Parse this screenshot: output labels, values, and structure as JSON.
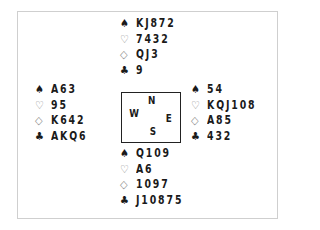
{
  "diagram": {
    "type": "bridge-deal",
    "suit_symbols": {
      "spades": "♠",
      "hearts": "♡",
      "diamonds": "◇",
      "clubs": "♣"
    },
    "colors": {
      "black_suit": "#1a1a1a",
      "red_suit_outline": "#8a8a8a",
      "frame": "#cfcfcf",
      "compass_border": "#222222"
    },
    "compass": {
      "north": "N",
      "south": "S",
      "east": "E",
      "west": "W"
    },
    "hands": {
      "north": {
        "spades": "KJ872",
        "hearts": "7432",
        "diamonds": "QJ3",
        "clubs": "9"
      },
      "west": {
        "spades": "A63",
        "hearts": "95",
        "diamonds": "K642",
        "clubs": "AKQ6"
      },
      "east": {
        "spades": "54",
        "hearts": "KQJ108",
        "diamonds": "A85",
        "clubs": "432"
      },
      "south": {
        "spades": "Q109",
        "hearts": "A6",
        "diamonds": "1097",
        "clubs": "J10875"
      }
    }
  }
}
